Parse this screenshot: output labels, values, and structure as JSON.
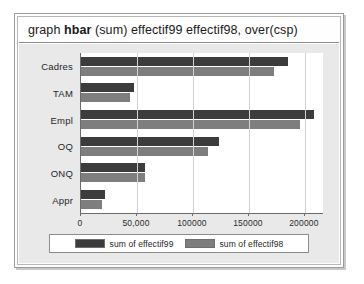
{
  "window": {
    "command_bar": {
      "prefix": "graph",
      "keyword": "hbar",
      "suffix": "(sum) effectif99 effectif98, over(csp)"
    }
  },
  "chart_data": {
    "type": "bar",
    "orientation": "horizontal",
    "title": "",
    "xlabel": "",
    "ylabel": "",
    "grid": true,
    "legend_position": "bottom",
    "xlim": [
      0,
      217000
    ],
    "categories": [
      "Cadres",
      "TAM",
      "Empl",
      "OQ",
      "ONQ",
      "Appr"
    ],
    "xticks": [
      0,
      50000,
      100000,
      150000,
      200000
    ],
    "xticklabels": [
      "0",
      "50,000",
      "100000",
      "150000",
      "200000"
    ],
    "series": [
      {
        "name": "sum of effectif99",
        "color": "#3c3c3c",
        "values": [
          185000,
          47000,
          208000,
          123000,
          57000,
          21000
        ]
      },
      {
        "name": "sum of effectif98",
        "color": "#7e7e7e",
        "values": [
          172000,
          44000,
          196000,
          113000,
          57000,
          19000
        ]
      }
    ]
  }
}
